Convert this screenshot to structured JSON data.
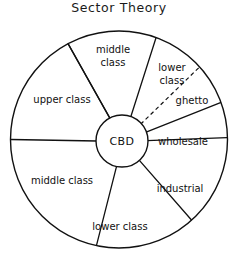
{
  "figure": {
    "title": "Sector  Theory",
    "background_color": "#ffffff",
    "line_color": "#111111"
  },
  "core": {
    "label": "CBD",
    "center_x": 122,
    "center_y": 141,
    "radius": 26
  },
  "outer_circle": {
    "center_x": 119,
    "center_y": 139.5,
    "radius": 109
  },
  "chart_data": {
    "type": "pie",
    "title": "Sector  Theory",
    "xlabel": "",
    "ylabel": "",
    "legend_position": "none",
    "grid": false,
    "center_label": "CBD",
    "categories": [
      "middle class",
      "lower class",
      "ghetto",
      "wholesale",
      "industrial",
      "lower class",
      "middle class",
      "upper class"
    ],
    "values": [
      48,
      28,
      22,
      19,
      49,
      54,
      78,
      62
    ]
  },
  "sectors": [
    {
      "name": "middle-class-top",
      "label_line1": "middle",
      "label_line2": "class",
      "start_angle": -118,
      "end_angle": -70,
      "label_x": 113,
      "label_y": 56,
      "two_line": true
    },
    {
      "name": "lower-class-upper-right",
      "label_line1": "lower",
      "label_line2": "class",
      "start_angle": -70,
      "end_angle": -42,
      "label_x": 172,
      "label_y": 74,
      "two_line": true
    },
    {
      "name": "ghetto",
      "label_line1": "ghetto",
      "label_line2": "",
      "start_angle": -42,
      "end_angle": -20,
      "label_x": 192,
      "label_y": 101,
      "two_line": false
    },
    {
      "name": "wholesale",
      "label_line1": "wholesale",
      "label_line2": "",
      "start_angle": -20,
      "end_angle": -1,
      "label_x": 183,
      "label_y": 142,
      "two_line": false
    },
    {
      "name": "industrial",
      "label_line1": "industrial",
      "label_line2": "",
      "start_angle": -1,
      "end_angle": 48,
      "label_x": 180,
      "label_y": 189,
      "two_line": false
    },
    {
      "name": "lower-class-bottom",
      "label_line1": "lower class",
      "label_line2": "",
      "start_angle": 48,
      "end_angle": 102,
      "label_x": 120,
      "label_y": 227,
      "two_line": false
    },
    {
      "name": "middle-class-left",
      "label_line1": "middle class",
      "label_line2": "",
      "start_angle": 102,
      "end_angle": 180,
      "label_x": 62,
      "label_y": 181,
      "two_line": false
    },
    {
      "name": "upper-class",
      "label_line1": "upper class",
      "label_line2": "",
      "start_angle": 180,
      "end_angle": 242,
      "label_x": 62,
      "label_y": 100,
      "two_line": false
    }
  ],
  "dividers": [
    {
      "name": "divider-middle-upper",
      "angle": -118,
      "dashed": false
    },
    {
      "name": "divider-middle-lower",
      "angle": -70,
      "dashed": false
    },
    {
      "name": "divider-lower-ghetto",
      "angle": -42,
      "dashed": true
    },
    {
      "name": "divider-ghetto-wholesale",
      "angle": -20,
      "dashed": false
    },
    {
      "name": "divider-wholesale-industrial",
      "angle": -1,
      "dashed": false
    },
    {
      "name": "divider-industrial-lowerbottom",
      "angle": 48,
      "dashed": false
    },
    {
      "name": "divider-lowerbottom-middleleft",
      "angle": 102,
      "dashed": false
    },
    {
      "name": "divider-middleleft-upper",
      "angle": 180,
      "dashed": false
    },
    {
      "name": "divider-upper-middletop",
      "angle": 242,
      "dashed": false
    }
  ]
}
